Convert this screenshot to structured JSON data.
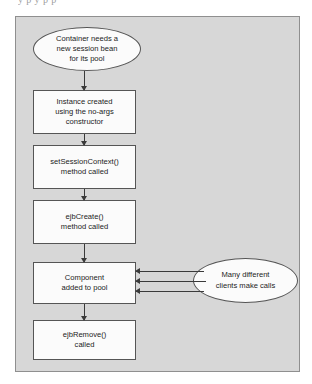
{
  "page": {
    "clipped_text_above": "y p y p p"
  },
  "figure": {
    "panel": {
      "background_color": "#d7d7d7",
      "border_color": "#8f8f8f"
    },
    "node_fill_color": "#fbfbfb",
    "node_border_color": "#555555",
    "arrow_color": "#3a3a3a",
    "nodes": [
      {
        "id": "container-needs-bean",
        "shape": "ellipse",
        "lines": [
          "Container needs a",
          "new session bean",
          "for its pool"
        ]
      },
      {
        "id": "instance-created",
        "shape": "rectangle",
        "lines": [
          "Instance created",
          "using the no-args",
          "constructor"
        ]
      },
      {
        "id": "set-session-context",
        "shape": "rectangle",
        "lines": [
          "setSessionContext()",
          "method called"
        ]
      },
      {
        "id": "ejb-create",
        "shape": "rectangle",
        "lines": [
          "ejbCreate()",
          "method called"
        ]
      },
      {
        "id": "component-added-to-pool",
        "shape": "rectangle",
        "lines": [
          "Component",
          "added to pool"
        ]
      },
      {
        "id": "ejb-remove",
        "shape": "rectangle",
        "lines": [
          "ejbRemove()",
          "called"
        ]
      },
      {
        "id": "many-clients",
        "shape": "ellipse",
        "lines": [
          "Many different",
          "clients make calls"
        ]
      }
    ],
    "connectors": [
      {
        "from": "container-needs-bean",
        "to": "instance-created",
        "direction": "down"
      },
      {
        "from": "instance-created",
        "to": "set-session-context",
        "direction": "down"
      },
      {
        "from": "set-session-context",
        "to": "ejb-create",
        "direction": "down"
      },
      {
        "from": "ejb-create",
        "to": "component-added-to-pool",
        "direction": "down"
      },
      {
        "from": "component-added-to-pool",
        "to": "ejb-remove",
        "direction": "down"
      },
      {
        "from": "many-clients",
        "to": "component-added-to-pool",
        "direction": "left"
      },
      {
        "from": "many-clients",
        "to": "component-added-to-pool",
        "direction": "left"
      },
      {
        "from": "many-clients",
        "to": "component-added-to-pool",
        "direction": "left"
      }
    ]
  }
}
